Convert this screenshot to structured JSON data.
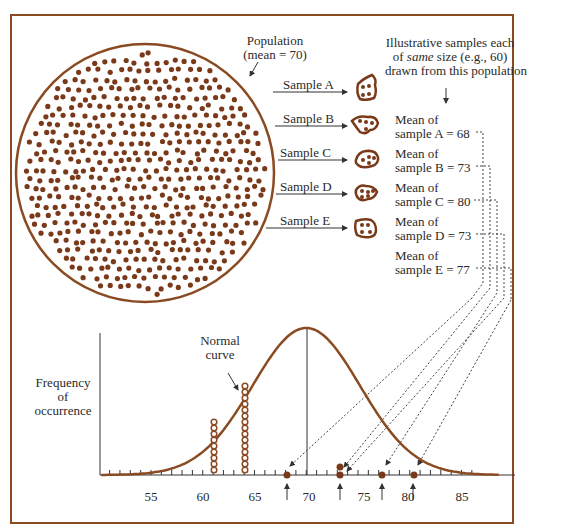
{
  "population": {
    "label_line1": "Population",
    "label_line2": "(mean = 70)",
    "mean": 70
  },
  "header_note": {
    "line1": "Illustrative samples each",
    "line2_pre": "of ",
    "line2_em": "same",
    "line2_post": " size (e.g., 60)",
    "line3": "drawn from this population"
  },
  "samples": [
    {
      "name": "Sample A",
      "mean_line1": "Mean of",
      "mean_line2": "sample A = 68",
      "mean": 68
    },
    {
      "name": "Sample B",
      "mean_line1": "Mean of",
      "mean_line2": "sample B = 73",
      "mean": 73
    },
    {
      "name": "Sample C",
      "mean_line1": "Mean of",
      "mean_line2": "sample C = 80",
      "mean": 80
    },
    {
      "name": "Sample D",
      "mean_line1": "Mean of",
      "mean_line2": "sample D = 73",
      "mean": 73
    },
    {
      "name": "Sample E",
      "mean_line1": "Mean of",
      "mean_line2": "sample E = 77",
      "mean": 77
    }
  ],
  "curve": {
    "label_line1": "Normal",
    "label_line2": "curve"
  },
  "y_axis": {
    "line1": "Frequency",
    "line2": "of",
    "line3": "occurrence"
  },
  "x_axis": {
    "ticks": [
      "55",
      "60",
      "65",
      "70",
      "75",
      "80",
      "85"
    ]
  },
  "colors": {
    "brown": "#8a4a22",
    "dot": "#7a3a1a",
    "text": "#2a2a2a"
  },
  "chart_data": {
    "type": "line",
    "xlabel": "",
    "ylabel": "Frequency of occurrence",
    "x_ticks": [
      55,
      60,
      65,
      70,
      75,
      80,
      85
    ],
    "xlim": [
      50,
      89
    ],
    "distribution": "normal",
    "mean": 70,
    "plotted_sample_means": [
      68,
      73,
      73,
      77,
      80
    ],
    "illustrative_stacks": [
      {
        "x": 61,
        "count": 9
      },
      {
        "x": 64,
        "count": 15
      }
    ],
    "annotations": [
      "Normal curve",
      "Population (mean = 70)"
    ]
  }
}
